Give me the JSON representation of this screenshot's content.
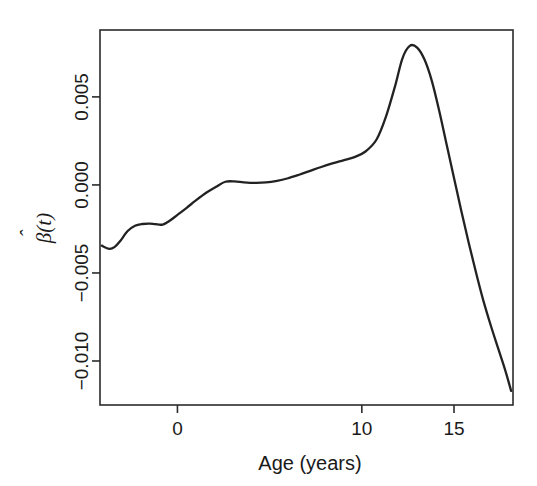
{
  "chart_data": {
    "type": "line",
    "title": "",
    "xlabel": "Age (years)",
    "ylabel": "β̂(t)",
    "ylabel_parts": {
      "hat_base": "β",
      "hat": "ˆ",
      "arg": "(t)"
    },
    "grid": false,
    "legend": null,
    "xlim": [
      -4.2,
      18.2
    ],
    "ylim": [
      -0.0125,
      0.0088
    ],
    "xticks": [
      0,
      10,
      15
    ],
    "xtick_labels": [
      "0",
      "10",
      "15"
    ],
    "yticks": [
      0.005,
      0.0,
      -0.005,
      -0.01
    ],
    "ytick_labels": [
      "0.005",
      "0.000",
      "−0.005",
      "−0.010"
    ],
    "series": [
      {
        "name": "beta_hat",
        "color": "#222222",
        "x": [
          -4.1,
          -3.7,
          -3.4,
          -3.1,
          -2.7,
          -2.3,
          -1.9,
          -1.5,
          -1.2,
          -0.8,
          -0.4,
          0.0,
          0.5,
          1.0,
          1.6,
          2.1,
          2.6,
          3.1,
          3.6,
          4.2,
          4.8,
          5.4,
          6.0,
          6.6,
          7.2,
          7.8,
          8.4,
          9.0,
          9.6,
          10.2,
          10.8,
          11.3,
          11.8,
          12.2,
          12.6,
          13.0,
          13.4,
          13.8,
          14.2,
          14.6,
          15.0,
          15.4,
          15.8,
          16.2,
          16.6,
          17.0,
          17.4,
          17.8,
          18.1
        ],
        "y": [
          -0.00345,
          -0.00363,
          -0.00352,
          -0.00318,
          -0.00262,
          -0.00232,
          -0.00222,
          -0.0022,
          -0.00223,
          -0.00225,
          -0.00202,
          -0.0017,
          -0.0013,
          -0.00088,
          -0.00042,
          -0.0001,
          0.00018,
          0.0002,
          0.00015,
          0.00012,
          0.00014,
          0.00023,
          0.00038,
          0.00058,
          0.0008,
          0.00102,
          0.00122,
          0.0014,
          0.00158,
          0.0019,
          0.00258,
          0.00385,
          0.0056,
          0.00718,
          0.0079,
          0.0078,
          0.00712,
          0.0059,
          0.0042,
          0.0023,
          0.0004,
          -0.0015,
          -0.0033,
          -0.005,
          -0.0066,
          -0.008,
          -0.0093,
          -0.0106,
          -0.0117
        ]
      }
    ]
  },
  "figure": {
    "background_color": "#ffffff",
    "axis_color": "#2b2b2b",
    "curve_color": "#222222"
  }
}
